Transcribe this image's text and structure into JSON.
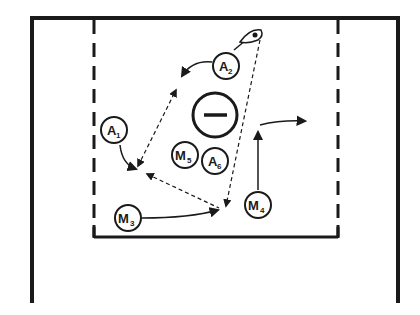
{
  "diagram": {
    "type": "lacrosse-play",
    "colors": {
      "ink": "#1a1a1a",
      "background": "#ffffff"
    },
    "goalie": {
      "symbol": "—",
      "description": "goal crease"
    },
    "players": [
      {
        "id": "A1",
        "letter": "A",
        "number": "1",
        "role": "attack"
      },
      {
        "id": "A2",
        "letter": "A",
        "number": "2",
        "role": "attack"
      },
      {
        "id": "M3",
        "letter": "M",
        "number": "3",
        "role": "midfield"
      },
      {
        "id": "M4",
        "letter": "M",
        "number": "4",
        "role": "midfield"
      },
      {
        "id": "M5",
        "letter": "M",
        "number": "5",
        "role": "midfield"
      },
      {
        "id": "A6",
        "letter": "A",
        "number": "6",
        "role": "attack"
      }
    ],
    "movements": [
      {
        "from": "A2",
        "type": "cut",
        "direction": "left"
      },
      {
        "from": "A1",
        "type": "cut",
        "direction": "down"
      },
      {
        "from": "M3",
        "type": "cut",
        "direction": "right"
      },
      {
        "from": "M4",
        "type": "cut",
        "direction": "up-then-right"
      }
    ],
    "passes": [
      {
        "from": "ball",
        "to": "lower-center",
        "style": "dashed"
      },
      {
        "between": [
          "upper-left",
          "lower-left"
        ],
        "style": "dashed"
      },
      {
        "between": [
          "lower-left",
          "lower-center"
        ],
        "style": "dashed"
      }
    ]
  }
}
